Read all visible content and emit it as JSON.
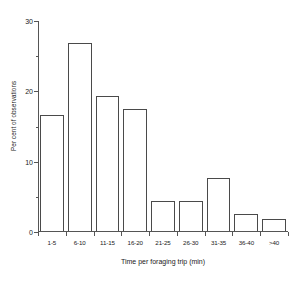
{
  "chart_data": {
    "type": "bar",
    "title": "",
    "xlabel": "Time per foraging trip (min)",
    "ylabel": "Per cent of observations",
    "categories": [
      "1-5",
      "6-10",
      "11-15",
      "16-20",
      "21-25",
      "26-30",
      "31-35",
      "36-40",
      ">40"
    ],
    "values": [
      16.5,
      26.8,
      19.2,
      17.4,
      4.3,
      4.3,
      7.5,
      2.4,
      1.7
    ],
    "ylim": [
      0,
      30
    ],
    "ymajor_ticks": [
      0,
      10,
      20,
      30
    ],
    "ymajor_tick_labels": [
      "0",
      "10",
      "20",
      "30"
    ],
    "yminor_ticks": [
      5,
      15,
      25
    ],
    "grid": false,
    "legend": null,
    "bar_style": {
      "fill": "none",
      "edge_color": "#4a4a4a"
    },
    "axis_color": "#555555"
  }
}
